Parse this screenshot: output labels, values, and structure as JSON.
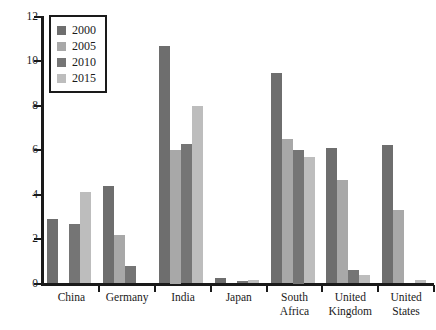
{
  "chart_data": {
    "type": "bar",
    "title": "",
    "subtitle": "",
    "xlabel": "",
    "ylabel": "",
    "ylim": [
      0,
      12
    ],
    "yticks": [
      0,
      2,
      4,
      6,
      8,
      10,
      12
    ],
    "grid": false,
    "legend_position": "top-left",
    "categories": [
      "China",
      "Germany",
      "India",
      "Japan",
      "South Africa",
      "United Kingdom",
      "United States"
    ],
    "category_labels": [
      [
        "China"
      ],
      [
        "Germany"
      ],
      [
        "India"
      ],
      [
        "Japan"
      ],
      [
        "South",
        "Africa"
      ],
      [
        "United",
        "Kingdom"
      ],
      [
        "United",
        "States"
      ]
    ],
    "series": [
      {
        "name": "2000",
        "color": "#6e6e6e",
        "values": [
          2.9,
          4.4,
          10.7,
          0.25,
          9.5,
          6.1,
          6.25
        ]
      },
      {
        "name": "2005",
        "color": "#a8a8a8",
        "values": [
          0.0,
          2.2,
          6.0,
          0.0,
          6.5,
          4.65,
          3.3
        ]
      },
      {
        "name": "2010",
        "color": "#757575",
        "values": [
          2.7,
          0.8,
          6.3,
          0.1,
          6.0,
          0.6,
          0.0
        ]
      },
      {
        "name": "2015",
        "color": "#bdbdbd",
        "values": [
          4.1,
          0.0,
          8.0,
          0.15,
          5.7,
          0.4,
          0.15
        ]
      }
    ]
  },
  "legend": {
    "entries": [
      {
        "label": "2000",
        "color": "#6e6e6e"
      },
      {
        "label": "2005",
        "color": "#a8a8a8"
      },
      {
        "label": "2010",
        "color": "#757575"
      },
      {
        "label": "2015",
        "color": "#bdbdbd"
      }
    ]
  },
  "axis": {
    "y_tick_labels": [
      "0",
      "2",
      "4",
      "6",
      "8",
      "10",
      "12"
    ]
  },
  "colors": {
    "axis": "#1a1a1a",
    "background": "#ffffff",
    "text": "#1a1a1a"
  }
}
